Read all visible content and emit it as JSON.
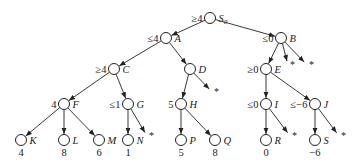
{
  "diagram": {
    "type": "alpha-beta game tree",
    "nodes": [
      {
        "id": "S0",
        "label": "S",
        "sub": "0",
        "bound": "≥4",
        "x": 210,
        "y": 18
      },
      {
        "id": "A",
        "label": "A",
        "bound": "≤4",
        "x": 166,
        "y": 38
      },
      {
        "id": "B",
        "label": "B",
        "bound": "≤0",
        "x": 281,
        "y": 38
      },
      {
        "id": "C",
        "label": "C",
        "bound": "≥4",
        "x": 114,
        "y": 69
      },
      {
        "id": "D",
        "label": "D",
        "bound": "",
        "x": 190,
        "y": 69
      },
      {
        "id": "E",
        "label": "E",
        "bound": "≥0",
        "x": 266,
        "y": 69
      },
      {
        "id": "F",
        "label": "F",
        "bound": "4",
        "x": 64,
        "y": 104
      },
      {
        "id": "G",
        "label": "G",
        "bound": "≤1",
        "x": 128,
        "y": 104
      },
      {
        "id": "H",
        "label": "H",
        "bound": "5",
        "x": 181,
        "y": 104
      },
      {
        "id": "I",
        "label": "I",
        "bound": "≤0",
        "x": 266,
        "y": 104
      },
      {
        "id": "J",
        "label": "J",
        "bound": "≤−6",
        "x": 315,
        "y": 104
      },
      {
        "id": "K",
        "label": "K",
        "value": "4",
        "x": 21,
        "y": 140
      },
      {
        "id": "L",
        "label": "L",
        "value": "8",
        "x": 64,
        "y": 140
      },
      {
        "id": "M",
        "label": "M",
        "value": "6",
        "x": 99,
        "y": 140
      },
      {
        "id": "N",
        "label": "N",
        "value": "1",
        "x": 128,
        "y": 140
      },
      {
        "id": "P",
        "label": "P",
        "value": "5",
        "x": 181,
        "y": 140
      },
      {
        "id": "Q",
        "label": "Q",
        "value": "8",
        "x": 215,
        "y": 140
      },
      {
        "id": "R",
        "label": "R",
        "value": "0",
        "x": 266,
        "y": 140
      },
      {
        "id": "S",
        "label": "S",
        "value": "−6",
        "x": 315,
        "y": 140
      }
    ],
    "edges": [
      [
        "S0",
        "A"
      ],
      [
        "S0",
        "B"
      ],
      [
        "A",
        "C"
      ],
      [
        "A",
        "D"
      ],
      [
        "B",
        "E"
      ],
      [
        "B",
        "*1"
      ],
      [
        "B",
        "*2"
      ],
      [
        "C",
        "F"
      ],
      [
        "C",
        "G"
      ],
      [
        "D",
        "H"
      ],
      [
        "D",
        "*3"
      ],
      [
        "E",
        "I"
      ],
      [
        "E",
        "J"
      ],
      [
        "F",
        "K"
      ],
      [
        "F",
        "L"
      ],
      [
        "F",
        "M"
      ],
      [
        "G",
        "N"
      ],
      [
        "G",
        "*4"
      ],
      [
        "H",
        "P"
      ],
      [
        "H",
        "Q"
      ],
      [
        "I",
        "R"
      ],
      [
        "I",
        "*5"
      ],
      [
        "J",
        "S"
      ],
      [
        "J",
        "*6"
      ]
    ],
    "pruned_marker": "*",
    "pruned": [
      {
        "id": "*1",
        "x": 288,
        "y": 65
      },
      {
        "id": "*2",
        "x": 307,
        "y": 65
      },
      {
        "id": "*3",
        "x": 212,
        "y": 92
      },
      {
        "id": "*4",
        "x": 147,
        "y": 136
      },
      {
        "id": "*5",
        "x": 290,
        "y": 136
      },
      {
        "id": "*6",
        "x": 339,
        "y": 136
      }
    ]
  }
}
